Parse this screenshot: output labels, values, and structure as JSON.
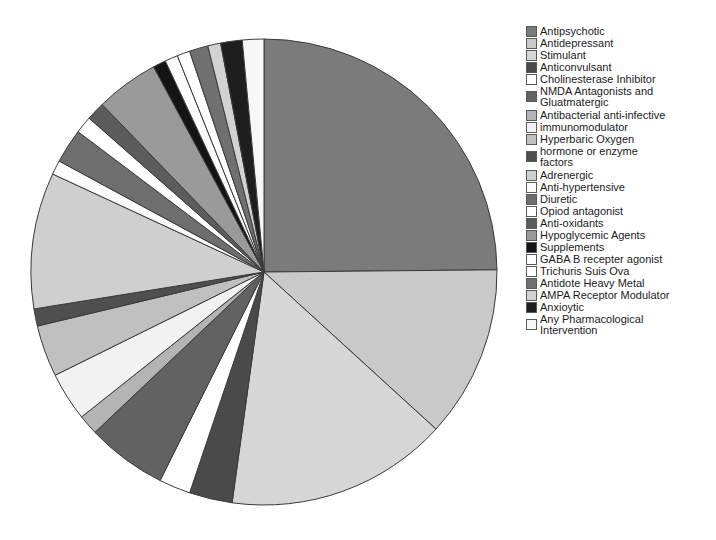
{
  "chart_data": {
    "type": "pie",
    "title": "",
    "subtitle": "",
    "xlabel": "",
    "ylabel": "",
    "grid": false,
    "legend_position": "right",
    "start_angle_deg": 0,
    "direction": "clockwise",
    "center": {
      "x": 264,
      "y": 272
    },
    "radius": 233,
    "stroke_color": "#3a3a3a",
    "background": "#ffffff",
    "categories": [
      "Antipsychotic",
      "Antidepressant",
      "Stimulant",
      "Anticonvulsant",
      "Cholinesterase Inhibitor",
      "NMDA Antagonists and Gluatmatergic",
      "Antibacterial anti-infective",
      "immunomodulator",
      "Hyperbaric Oxygen",
      "hormone or enzyme factors",
      "Adrenergic",
      "Anti-hypertensive",
      "Diuretic",
      "Opiod antagonist",
      "Anti-oxidants",
      "Hypoglycemic Agents",
      "Supplements",
      "GABA B recepter agonist",
      "Trichuris Suis Ova",
      "Antidote Heavy Metal",
      "AMPA Receptor Modulator",
      "Anxioytic",
      "Any Pharmacological Intervention"
    ],
    "values": [
      25.0,
      12.0,
      15.5,
      3.0,
      2.2,
      5.6,
      1.4,
      3.4,
      3.6,
      1.2,
      9.5,
      1.0,
      2.4,
      1.2,
      1.3,
      4.4,
      0.9,
      0.9,
      0.9,
      1.3,
      0.9,
      1.5,
      1.5
    ],
    "colors": [
      "#7b7b7b",
      "#c9c9c9",
      "#d6d6d6",
      "#4a4a4a",
      "#ffffff",
      "#626262",
      "#b4b4b4",
      "#f2f2f2",
      "#c0c0c0",
      "#4f4f4f",
      "#cfcfcf",
      "#fbfbfb",
      "#6e6e6e",
      "#ffffff",
      "#5c5c5c",
      "#9a9a9a",
      "#141414",
      "#fdfdfd",
      "#ffffff",
      "#707070",
      "#d2d2d2",
      "#1e1e1e",
      "#f7f7f7"
    ]
  },
  "legend": {
    "items": [
      {
        "label": "Antipsychotic",
        "color": "#7b7b7b",
        "wrapped": false
      },
      {
        "label": "Antidepressant",
        "color": "#c9c9c9",
        "wrapped": false
      },
      {
        "label": "Stimulant",
        "color": "#d6d6d6",
        "wrapped": false
      },
      {
        "label": "Anticonvulsant",
        "color": "#4a4a4a",
        "wrapped": false
      },
      {
        "label": "Cholinesterase Inhibitor",
        "color": "#ffffff",
        "wrapped": false
      },
      {
        "label": "NMDA Antagonists and\nGluatmatergic",
        "color": "#626262",
        "wrapped": true
      },
      {
        "label": "Antibacterial anti-infective",
        "color": "#b4b4b4",
        "wrapped": false
      },
      {
        "label": "immunomodulator",
        "color": "#f2f2f2",
        "wrapped": false
      },
      {
        "label": "Hyperbaric Oxygen",
        "color": "#c0c0c0",
        "wrapped": false
      },
      {
        "label": "hormone or enzyme\nfactors",
        "color": "#4f4f4f",
        "wrapped": true
      },
      {
        "label": "Adrenergic",
        "color": "#cfcfcf",
        "wrapped": false
      },
      {
        "label": "Anti-hypertensive",
        "color": "#fbfbfb",
        "wrapped": false
      },
      {
        "label": "Diuretic",
        "color": "#6e6e6e",
        "wrapped": false
      },
      {
        "label": "Opiod antagonist",
        "color": "#ffffff",
        "wrapped": false
      },
      {
        "label": "Anti-oxidants",
        "color": "#5c5c5c",
        "wrapped": false
      },
      {
        "label": "Hypoglycemic Agents",
        "color": "#9a9a9a",
        "wrapped": false
      },
      {
        "label": "Supplements",
        "color": "#141414",
        "wrapped": false
      },
      {
        "label": "GABA B recepter agonist",
        "color": "#fdfdfd",
        "wrapped": false
      },
      {
        "label": "Trichuris Suis Ova",
        "color": "#ffffff",
        "wrapped": false
      },
      {
        "label": "Antidote Heavy Metal",
        "color": "#707070",
        "wrapped": false
      },
      {
        "label": "AMPA Receptor Modulator",
        "color": "#d2d2d2",
        "wrapped": false
      },
      {
        "label": "Anxioytic",
        "color": "#1e1e1e",
        "wrapped": false
      },
      {
        "label": "Any Pharmacological\nIntervention",
        "color": "#f7f7f7",
        "wrapped": true
      }
    ]
  }
}
